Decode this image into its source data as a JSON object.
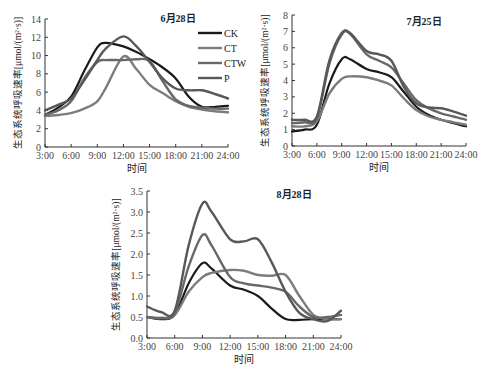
{
  "chart_data": [
    {
      "type": "line",
      "title": "6月28日",
      "xlabel": "时间",
      "ylabel": "生态系统呼吸速率[μmol/(m²·s)]",
      "x_ticks": [
        "3:00",
        "6:00",
        "9:00",
        "12:00",
        "15:00",
        "18:00",
        "21:00",
        "24:00"
      ],
      "y_ticks": [
        "0",
        "2",
        "4",
        "6",
        "8",
        "10",
        "12",
        "14"
      ],
      "ylim": [
        0,
        14
      ],
      "xlim": [
        3,
        24
      ],
      "grid": false,
      "legend_position": "top-right",
      "x": [
        3,
        4.5,
        6,
        7.5,
        9,
        10,
        12,
        13.5,
        15,
        16.5,
        18,
        19.5,
        21,
        22.5,
        24
      ],
      "series": [
        {
          "name": "CK",
          "color": "#1a1a1a",
          "values": [
            3.5,
            4.3,
            5.5,
            8.3,
            10.9,
            11.4,
            11.0,
            10.4,
            9.6,
            8.7,
            7.5,
            5.5,
            4.4,
            4.4,
            4.5
          ]
        },
        {
          "name": "CT",
          "color": "#7c7c7c",
          "values": [
            3.4,
            3.5,
            3.7,
            4.2,
            5.0,
            6.5,
            9.9,
            8.5,
            6.8,
            5.9,
            5.0,
            4.4,
            4.1,
            3.9,
            3.8
          ]
        },
        {
          "name": "CTW",
          "color": "#686868",
          "values": [
            3.5,
            4.0,
            5.0,
            7.5,
            9.3,
            9.5,
            9.5,
            9.6,
            9.4,
            7.2,
            5.2,
            4.5,
            4.3,
            4.2,
            4.2
          ]
        },
        {
          "name": "P",
          "color": "#585858",
          "values": [
            4.0,
            4.6,
            5.3,
            7.3,
            9.5,
            10.8,
            12.1,
            11.0,
            9.3,
            7.5,
            6.4,
            6.2,
            6.2,
            5.8,
            5.3
          ]
        }
      ]
    },
    {
      "type": "line",
      "title": "7月25日",
      "xlabel": "时间",
      "ylabel": "生态系统呼吸速率[μmol/(m²·s)]",
      "x_ticks": [
        "3:00",
        "6:00",
        "9:00",
        "12:00",
        "15:00",
        "18:00",
        "21:00",
        "24:00"
      ],
      "y_ticks": [
        "0",
        "1",
        "2",
        "3",
        "4",
        "5",
        "6",
        "7",
        "8"
      ],
      "ylim": [
        0,
        8
      ],
      "xlim": [
        3,
        24
      ],
      "grid": false,
      "x": [
        3,
        4.5,
        6,
        7.5,
        9,
        10,
        12,
        13.5,
        15,
        16.5,
        18,
        19.5,
        21,
        22.5,
        24
      ],
      "series": [
        {
          "name": "CK",
          "color": "#1a1a1a",
          "values": [
            0.9,
            1.0,
            1.3,
            3.8,
            5.3,
            5.3,
            4.7,
            4.5,
            4.2,
            3.3,
            2.4,
            1.9,
            1.6,
            1.4,
            1.2
          ]
        },
        {
          "name": "CT",
          "color": "#7c7c7c",
          "values": [
            1.2,
            1.2,
            1.5,
            3.2,
            4.1,
            4.25,
            4.2,
            4.0,
            3.7,
            2.9,
            2.2,
            1.8,
            1.6,
            1.45,
            1.3
          ]
        },
        {
          "name": "CTW",
          "color": "#686868",
          "values": [
            1.4,
            1.45,
            1.7,
            5.0,
            6.8,
            6.85,
            5.6,
            5.2,
            4.8,
            3.8,
            2.8,
            2.3,
            2.0,
            1.8,
            1.6
          ]
        },
        {
          "name": "P",
          "color": "#585858",
          "values": [
            1.6,
            1.6,
            1.8,
            5.2,
            6.9,
            6.9,
            5.8,
            5.6,
            5.2,
            3.6,
            2.6,
            2.35,
            2.3,
            2.1,
            1.85
          ]
        }
      ]
    },
    {
      "type": "line",
      "title": "8月28日",
      "xlabel": "时间",
      "ylabel": "生态系统呼吸速率[μmol/(m²·s)]",
      "x_ticks": [
        "3:00",
        "6:00",
        "9:00",
        "12:00",
        "15:00",
        "18:00",
        "21:00",
        "24:00"
      ],
      "y_ticks": [
        "0.0",
        "0.5",
        "1.0",
        "1.5",
        "2.0",
        "2.5",
        "3.0",
        "3.5"
      ],
      "ylim": [
        0,
        3.5
      ],
      "xlim": [
        3,
        24
      ],
      "grid": false,
      "x": [
        3,
        4.5,
        6,
        7.5,
        9,
        10,
        12,
        13.5,
        15,
        16.5,
        18,
        19.5,
        21,
        22.5,
        24
      ],
      "series": [
        {
          "name": "CK",
          "color": "#1a1a1a",
          "values": [
            0.5,
            0.45,
            0.55,
            1.3,
            1.78,
            1.65,
            1.25,
            1.15,
            1.0,
            0.7,
            0.45,
            0.43,
            0.45,
            0.45,
            0.45
          ]
        },
        {
          "name": "CT",
          "color": "#7c7c7c",
          "values": [
            0.5,
            0.48,
            0.55,
            1.1,
            1.45,
            1.55,
            1.62,
            1.6,
            1.5,
            1.48,
            1.5,
            1.0,
            0.55,
            0.45,
            0.45
          ]
        },
        {
          "name": "CTW",
          "color": "#686868",
          "values": [
            0.5,
            0.47,
            0.6,
            1.7,
            2.45,
            2.2,
            1.45,
            1.3,
            1.25,
            1.2,
            1.1,
            0.75,
            0.5,
            0.5,
            0.55
          ]
        },
        {
          "name": "P",
          "color": "#585858",
          "values": [
            0.75,
            0.62,
            0.65,
            2.2,
            3.2,
            3.0,
            2.35,
            2.3,
            2.35,
            1.8,
            1.1,
            0.6,
            0.45,
            0.4,
            0.65
          ]
        }
      ]
    }
  ],
  "legend": [
    {
      "name": "CK",
      "color": "#1a1a1a"
    },
    {
      "name": "CT",
      "color": "#7c7c7c"
    },
    {
      "name": "CTW",
      "color": "#686868"
    },
    {
      "name": "P",
      "color": "#585858"
    }
  ],
  "layout": [
    {
      "x0": 45,
      "x1": 228,
      "y0": 147,
      "y1": 19,
      "date_x": 178,
      "date_y": 22
    },
    {
      "x0": 292,
      "x1": 466,
      "y0": 146,
      "y1": 15,
      "date_x": 424,
      "date_y": 25
    },
    {
      "x0": 147,
      "x1": 341,
      "y0": 338,
      "y1": 191,
      "date_x": 294,
      "date_y": 198
    }
  ]
}
